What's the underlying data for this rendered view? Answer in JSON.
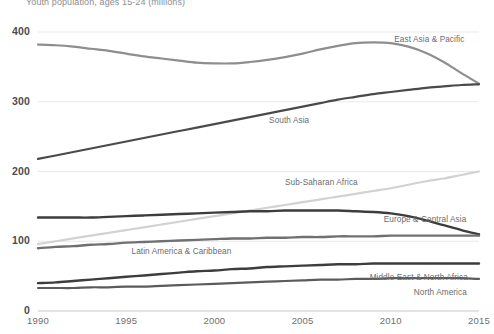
{
  "chart_data": {
    "type": "line",
    "title": "Youth population, ages 15-24 (millions)",
    "xlabel": "",
    "ylabel": "",
    "xlim": [
      1990,
      2015
    ],
    "ylim": [
      0,
      400
    ],
    "grid": true,
    "legend_position": "inline-labels",
    "yticks": [
      "0",
      "100",
      "200",
      "300",
      "400"
    ],
    "ytick_values": [
      0,
      100,
      200,
      300,
      400
    ],
    "xticks": [
      "1990",
      "1995",
      "2000",
      "2005",
      "2010",
      "2015"
    ],
    "xtick_values": [
      1990,
      1995,
      2000,
      2005,
      2010,
      2015
    ],
    "x": [
      1990,
      1991,
      1992,
      1993,
      1994,
      1995,
      1996,
      1997,
      1998,
      1999,
      2000,
      2001,
      2002,
      2003,
      2004,
      2005,
      2006,
      2007,
      2008,
      2009,
      2010,
      2011,
      2012,
      2013,
      2014,
      2015
    ],
    "series": [
      {
        "name": "East Asia & Pacific",
        "color": "#8e8e90",
        "width": 2.2,
        "label_x": 2010.2,
        "label_y": 388,
        "values": [
          382,
          381,
          379,
          376,
          373,
          369,
          365,
          362,
          359,
          356,
          355,
          355,
          357,
          360,
          364,
          369,
          375,
          380,
          384,
          385,
          384,
          379,
          370,
          357,
          341,
          326
        ]
      },
      {
        "name": "South Asia",
        "color": "#4a4a4c",
        "width": 2.2,
        "label_x": 2003.1,
        "label_y": 272,
        "values": [
          218,
          223,
          228,
          233,
          238,
          243,
          248,
          253,
          258,
          263,
          268,
          273,
          278,
          283,
          288,
          293,
          298,
          303,
          307,
          311,
          314,
          317,
          320,
          322,
          324,
          325
        ]
      },
      {
        "name": "Sub-Saharan Africa",
        "color": "#d2d2d4",
        "width": 2.2,
        "label_x": 2004.0,
        "label_y": 183,
        "values": [
          96,
          100,
          104,
          108,
          112,
          116,
          120,
          124,
          128,
          132,
          136,
          140,
          144,
          148,
          152,
          156,
          160,
          164,
          168,
          172,
          176,
          181,
          186,
          190,
          195,
          200
        ]
      },
      {
        "name": "Europe & Central Asia",
        "color": "#3d3d3f",
        "width": 2.4,
        "label_x": 2009.6,
        "label_y": 130,
        "values": [
          134,
          134,
          134,
          134,
          135,
          136,
          137,
          138,
          139,
          140,
          141,
          142,
          143,
          143,
          144,
          144,
          144,
          144,
          143,
          142,
          140,
          136,
          130,
          123,
          116,
          110
        ]
      },
      {
        "name": "Latin America & Caribbean",
        "color": "#707072",
        "width": 2.4,
        "label_x": 1995.3,
        "label_y": 84,
        "values": [
          90,
          92,
          93,
          95,
          96,
          98,
          99,
          100,
          101,
          102,
          103,
          104,
          104,
          105,
          105,
          106,
          106,
          107,
          107,
          107,
          108,
          108,
          108,
          108,
          108,
          108
        ]
      },
      {
        "name": "Middle East & North Africa",
        "color": "#3d3d3f",
        "width": 2.4,
        "label_x": 2008.8,
        "label_y": 48,
        "values": [
          40,
          41,
          43,
          45,
          47,
          49,
          51,
          53,
          55,
          57,
          58,
          60,
          61,
          63,
          64,
          65,
          66,
          67,
          67,
          68,
          68,
          68,
          68,
          68,
          68,
          68
        ]
      },
      {
        "name": "North America",
        "color": "#5b5b5d",
        "width": 2.2,
        "label_x": 2011.3,
        "label_y": 26,
        "values": [
          33,
          33,
          33,
          34,
          34,
          35,
          35,
          36,
          37,
          38,
          39,
          40,
          41,
          42,
          43,
          44,
          45,
          45,
          46,
          46,
          47,
          47,
          47,
          47,
          47,
          46
        ]
      }
    ]
  },
  "axis": {
    "grid_color": "#e9e9e9",
    "baseline_color": "#c8c8c8"
  }
}
